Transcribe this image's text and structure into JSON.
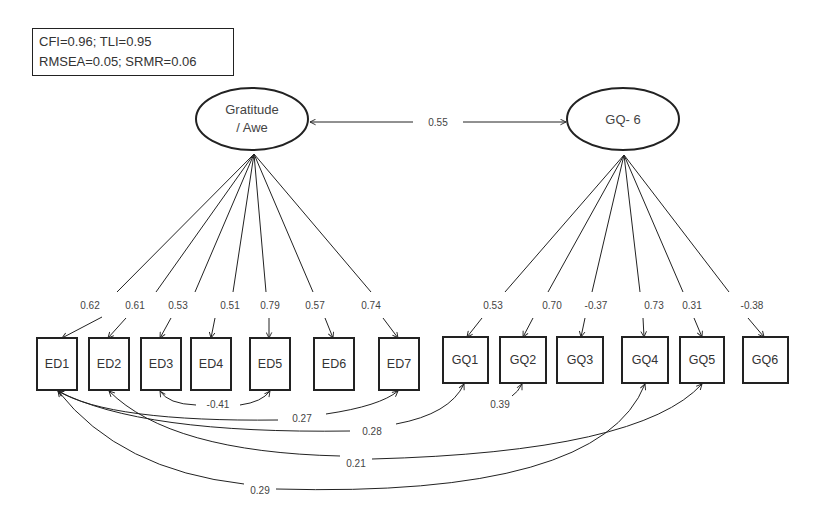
{
  "fit_indices": {
    "line1": "CFI=0.96; TLI=0.95",
    "line2": "RMSEA=0.05; SRMR=0.06"
  },
  "latents": [
    {
      "id": "gratitude-awe",
      "line1": "Gratitude",
      "line2": "/ Awe",
      "cx": 252,
      "cy": 119
    },
    {
      "id": "gq6",
      "line1": "GQ- 6",
      "line2": "",
      "cx": 623,
      "cy": 119
    }
  ],
  "latent_correlation": {
    "label": "0.55"
  },
  "indicators": {
    "ed": [
      {
        "name": "ED1",
        "loading": "0.62"
      },
      {
        "name": "ED2",
        "loading": "0.61"
      },
      {
        "name": "ED3",
        "loading": "0.53"
      },
      {
        "name": "ED4",
        "loading": "0.51"
      },
      {
        "name": "ED5",
        "loading": "0.79"
      },
      {
        "name": "ED6",
        "loading": "0.57"
      },
      {
        "name": "ED7",
        "loading": "0.74"
      }
    ],
    "gq": [
      {
        "name": "GQ1",
        "loading": "0.53"
      },
      {
        "name": "GQ2",
        "loading": "0.70"
      },
      {
        "name": "GQ3",
        "loading": "-0.37"
      },
      {
        "name": "GQ4",
        "loading": "0.73"
      },
      {
        "name": "GQ5",
        "loading": "0.31"
      },
      {
        "name": "GQ6",
        "loading": "-0.38"
      }
    ]
  },
  "residual_covariances": [
    {
      "from": "ED3",
      "to": "ED5",
      "label": "-0.41"
    },
    {
      "from": "ED1",
      "to": "ED7",
      "label": "0.27"
    },
    {
      "from": "ED1",
      "to": "GQ1",
      "label": "0.28"
    },
    {
      "from": "GQ1",
      "to": "GQ2",
      "label": "0.39"
    },
    {
      "from": "ED2",
      "to": "GQ5",
      "label": "0.21"
    },
    {
      "from": "ED1",
      "to": "GQ4",
      "label": "0.29"
    }
  ],
  "colors": {
    "stroke": "#222222",
    "text": "#333333"
  }
}
